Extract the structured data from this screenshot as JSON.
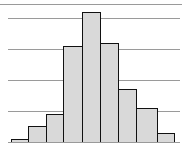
{
  "chart_data": {
    "type": "bar",
    "subtype": "histogram",
    "title": "",
    "xlabel": "",
    "ylabel": "",
    "categories": [
      "1",
      "2",
      "3",
      "4",
      "5",
      "6",
      "7",
      "8",
      "9"
    ],
    "values": [
      1,
      5,
      9,
      31,
      42,
      32,
      17,
      11,
      3
    ],
    "ylim": [
      0,
      45
    ],
    "grid": true,
    "gridlines_y": [
      10,
      20,
      30,
      40
    ],
    "legend": null,
    "colors": {
      "bar_fill": "#d9d9d9",
      "bar_edge": "#111111",
      "grid": "#9a9a9a"
    }
  }
}
